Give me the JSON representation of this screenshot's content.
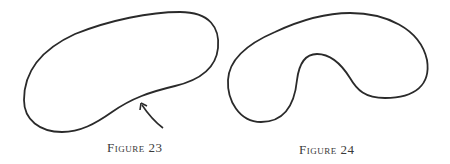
{
  "figures": [
    {
      "id": "figure-23",
      "caption": "Figure 23",
      "shape": "convex-ish kidney curve with arrow pointing at inward-bending edge"
    },
    {
      "id": "figure-24",
      "caption": "Figure 24",
      "shape": "kidney/bean shaped closed curve with deep indentation"
    }
  ],
  "colors": {
    "stroke": "#2a2a2a",
    "caption": "#3a3a3a",
    "background": "#ffffff"
  }
}
